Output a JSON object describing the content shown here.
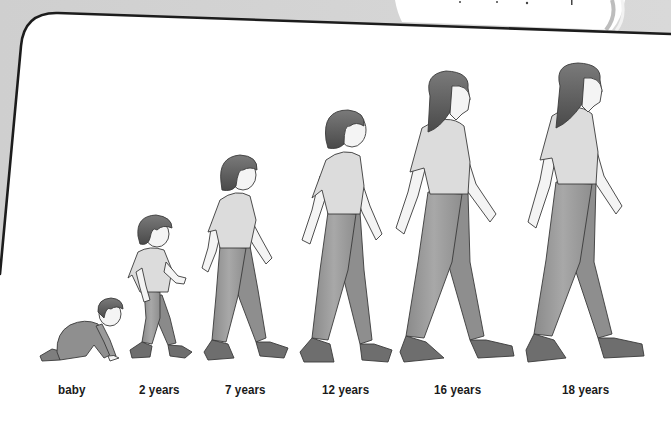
{
  "figure": {
    "top_caption_clipped": "",
    "colors": {
      "background_gray": "#d4d4d4",
      "frame_border": "#1c1c1c",
      "panel_white": "#ffffff",
      "hair": "#5a5a5a",
      "shirt": "#dcdcdc",
      "pants": "#9a9a9a",
      "skin": "#f4f4f4",
      "shoe": "#6e6e6e",
      "label_text": "#1a1a1a"
    },
    "stages": [
      {
        "label": "baby",
        "pose": "crawling"
      },
      {
        "label": "2 years",
        "pose": "walking"
      },
      {
        "label": "7 years",
        "pose": "walking"
      },
      {
        "label": "12 years",
        "pose": "walking"
      },
      {
        "label": "16 years",
        "pose": "walking"
      },
      {
        "label": "18 years",
        "pose": "walking"
      }
    ]
  }
}
